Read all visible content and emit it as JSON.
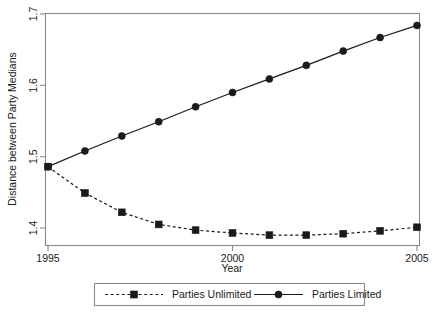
{
  "chart_data": {
    "type": "line",
    "title": "",
    "xlabel": "Year",
    "ylabel": "Distance between Party Medians",
    "x": [
      1995,
      1996,
      1997,
      1998,
      1999,
      2000,
      2001,
      2002,
      2003,
      2004,
      2005
    ],
    "xlim": [
      1995,
      2005
    ],
    "ylim": [
      1.4,
      1.7
    ],
    "xticks": [
      1995,
      2000,
      2005
    ],
    "xtick_labels": [
      "1995",
      "2000",
      "2005"
    ],
    "yticks": [
      1.4,
      1.5,
      1.6,
      1.7
    ],
    "ytick_labels": [
      "1.4",
      "1.5",
      "1.6",
      "1.7"
    ],
    "grid": false,
    "legend_position": "bottom-outside",
    "series": [
      {
        "name": "Parties Unlimited",
        "line_style": "dashed",
        "marker": "square",
        "color": "#1a1a1a",
        "values": [
          1.486,
          1.449,
          1.422,
          1.405,
          1.397,
          1.393,
          1.39,
          1.39,
          1.392,
          1.396,
          1.401
        ]
      },
      {
        "name": "Parties Limited",
        "line_style": "solid",
        "marker": "circle",
        "color": "#1a1a1a",
        "values": [
          1.486,
          1.508,
          1.529,
          1.549,
          1.57,
          1.59,
          1.609,
          1.628,
          1.648,
          1.667,
          1.684
        ]
      }
    ]
  },
  "legend": {
    "items": [
      {
        "label": "Parties Unlimited",
        "style": "dashed-square"
      },
      {
        "label": "Parties Limited",
        "style": "solid-circle"
      }
    ]
  },
  "colors": {
    "ink": "#1a1a1a",
    "frame": "#8a8a8a",
    "background": "#ffffff"
  }
}
